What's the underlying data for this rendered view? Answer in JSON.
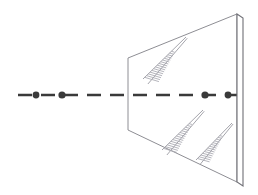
{
  "figure": {
    "title": "Perspective line drawing of a flat transparent panel intersected by a dashed axis",
    "width": 258,
    "height": 195,
    "background_color": "#ffffff"
  },
  "colors": {
    "axis_stroke": "#3a3a3a",
    "panel_outline": "#8e8e94",
    "panel_edge_slab": "#6f6f76",
    "glint_stroke": "#9a9aa2",
    "glint_hatch": "#a8a8b0",
    "panel_fill": "#ffffff"
  },
  "axis": {
    "name": "dashed-optical-axis",
    "y": 95,
    "x_start": 18,
    "x_end": 238,
    "stroke_width": 2.6,
    "dash_pattern": "14 9",
    "dash_label": "dashed"
  },
  "axis_nodes": [
    {
      "label": "node-1",
      "x": 36,
      "y": 95,
      "r": 3.4
    },
    {
      "label": "node-2",
      "x": 62,
      "y": 95,
      "r": 3.6
    },
    {
      "label": "node-3",
      "x": 205,
      "y": 95,
      "r": 3.6
    },
    {
      "label": "node-4",
      "x": 228,
      "y": 95,
      "r": 3.4
    }
  ],
  "panel": {
    "name": "trapezoidal-panel",
    "corners": [
      {
        "label": "top-left",
        "x": 128,
        "y": 58
      },
      {
        "label": "top-right",
        "x": 237,
        "y": 14
      },
      {
        "label": "bottom-right",
        "x": 237,
        "y": 182
      },
      {
        "label": "bottom-left",
        "x": 128,
        "y": 130
      }
    ],
    "stroke_width": 1.0
  },
  "edge_slab": {
    "name": "vertical-edge-slab",
    "x_front": 237,
    "x_back": 243,
    "y_top": 14,
    "y_bottom": 182,
    "top_cap_offset": 4,
    "stroke_width": 1.1
  },
  "glints": [
    {
      "label": "glint-upper",
      "x1": 143,
      "y1": 79,
      "x2": 186,
      "y2": 37,
      "hatch_count": 16,
      "hatch_length": 13,
      "spine_offset": 7
    },
    {
      "label": "glint-lower-left",
      "x1": 162,
      "y1": 150,
      "x2": 203,
      "y2": 110,
      "hatch_count": 15,
      "hatch_length": 12,
      "spine_offset": 7
    },
    {
      "label": "glint-lower-right",
      "x1": 196,
      "y1": 160,
      "x2": 232,
      "y2": 123,
      "hatch_count": 14,
      "hatch_length": 11,
      "spine_offset": 6
    }
  ]
}
